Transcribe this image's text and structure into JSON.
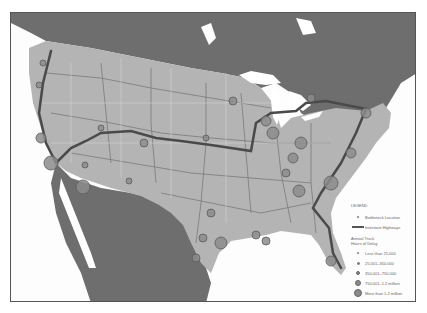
{
  "map": {
    "title": "Truck Bottlenecks on Interstate Highways",
    "colors": {
      "water": "#ffffff",
      "foreign_land": "#6e6e6e",
      "us_land": "#b4b4b4",
      "roads": "#7a7a7a",
      "highway": "#4a4a4a",
      "bottleneck_fill": "#8c8c8c",
      "bottleneck_stroke": "#5a5a5a",
      "frame": "#555555"
    }
  },
  "legend": {
    "title": "LEGEND",
    "bottleneck_label": "Bottleneck Location",
    "highway_label": "Interstate Highways",
    "delay_title_line1": "Annual Truck",
    "delay_title_line2": "Hours of Delay",
    "classes": [
      {
        "label": "Less than 25,000",
        "size": 2
      },
      {
        "label": "25,001–350,000",
        "size": 3
      },
      {
        "label": "350,001–750,000",
        "size": 4
      },
      {
        "label": "750,001–1.2 million",
        "size": 6
      },
      {
        "label": "More than 1.2 million",
        "size": 8
      }
    ]
  }
}
